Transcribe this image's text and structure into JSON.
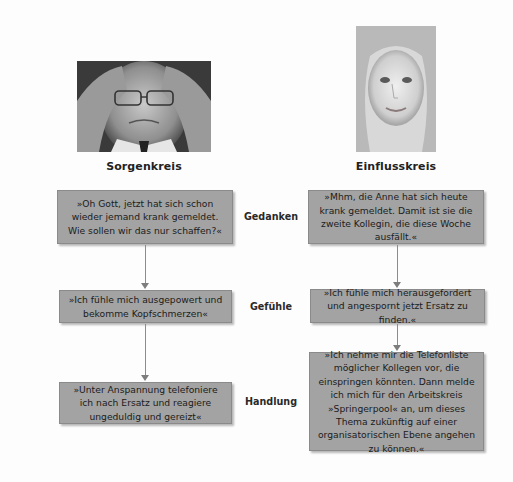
{
  "columns": {
    "left": {
      "heading": "Sorgenkreis",
      "photo": "stressed-man-photo",
      "boxes": [
        "»Oh Gott, jetzt hat sich schon wieder jemand krank gemeldet. Wie sollen wir das nur schaffen?«",
        "»Ich fühle mich ausgepowert und bekomme Kopfschmerzen«",
        "»Unter Anspannung telefoniere ich nach Ersatz und reagiere ungeduldig und gereizt«"
      ]
    },
    "right": {
      "heading": "Einflusskreis",
      "photo": "smiling-woman-photo",
      "boxes": [
        "»Mhm, die Anne hat sich heute krank gemeldet. Damit ist sie die zweite Kollegin, die diese Woche ausfällt.«",
        "»Ich fühle mich herausgefordert und angespornt jetzt Ersatz zu finden.«",
        "»Ich nehme mir die Telefonliste möglicher Kollegen vor, die einspringen könnten. Dann melde ich mich für den Arbeitskreis »Springerpool« an, um dieses Thema zukünftig auf einer organisatorischen Ebene angehen zu können.«"
      ]
    }
  },
  "row_labels": [
    "Gedanken",
    "Gefühle",
    "Handlung"
  ],
  "colors": {
    "box_fill": "#a3a3a3",
    "box_border": "#8a8a8a",
    "connector": "#8c8c8c",
    "background": "#fdfdfd"
  }
}
